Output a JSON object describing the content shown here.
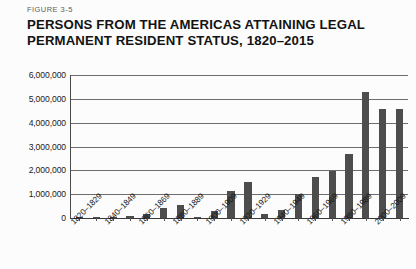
{
  "figure": {
    "number": "FIGURE 3-5",
    "title_line1": "PERSONS FROM THE AMERICAS ATTAINING LEGAL",
    "title_line2": "PERMANENT RESIDENT STATUS, 1820–2015"
  },
  "colors": {
    "bar": "#4d4d4d",
    "gridline": "#6e6e6e",
    "axis": "#3a3a3a",
    "text": "#141414",
    "background": "#fcfcfc"
  },
  "chart_data": {
    "type": "bar",
    "title": "PERSONS FROM THE AMERICAS ATTAINING LEGAL PERMANENT RESIDENT STATUS, 1820–2015",
    "xlabel": "",
    "ylabel": "",
    "ylim": [
      0,
      6000000
    ],
    "grid": true,
    "legend": null,
    "ytick_labels": [
      "6,000,000",
      "5,000,000",
      "4,000,000",
      "3,000,000",
      "2,000,000",
      "1,000,000",
      "0"
    ],
    "ytick_values": [
      6000000,
      5000000,
      4000000,
      3000000,
      2000000,
      1000000,
      0
    ],
    "categories": [
      "1820–1829",
      "1830–1839",
      "1840–1849",
      "1850–1859",
      "1860–1869",
      "1870–1879",
      "1880–1889",
      "1890–1899",
      "1900–1909",
      "1910–1919",
      "1920–1929",
      "1930–1939",
      "1940–1949",
      "1950–1959",
      "1960–1969",
      "1970–1979",
      "1980–1989",
      "1990–1999",
      "2000–2009",
      "2010–2015"
    ],
    "values": [
      12000,
      33000,
      62000,
      75000,
      167000,
      405000,
      527000,
      38000,
      278000,
      1145000,
      1517000,
      160000,
      355000,
      997000,
      1716000,
      1983000,
      2695000,
      5271000,
      4590000,
      4580000
    ],
    "visible_xtick_labels": [
      "1820–1829",
      "1840–1849",
      "1860–1869",
      "1880–1889",
      "1900–1909",
      "1920–1929",
      "1940–1949",
      "1960–1969",
      "1980–1989",
      "2000–2009"
    ]
  }
}
